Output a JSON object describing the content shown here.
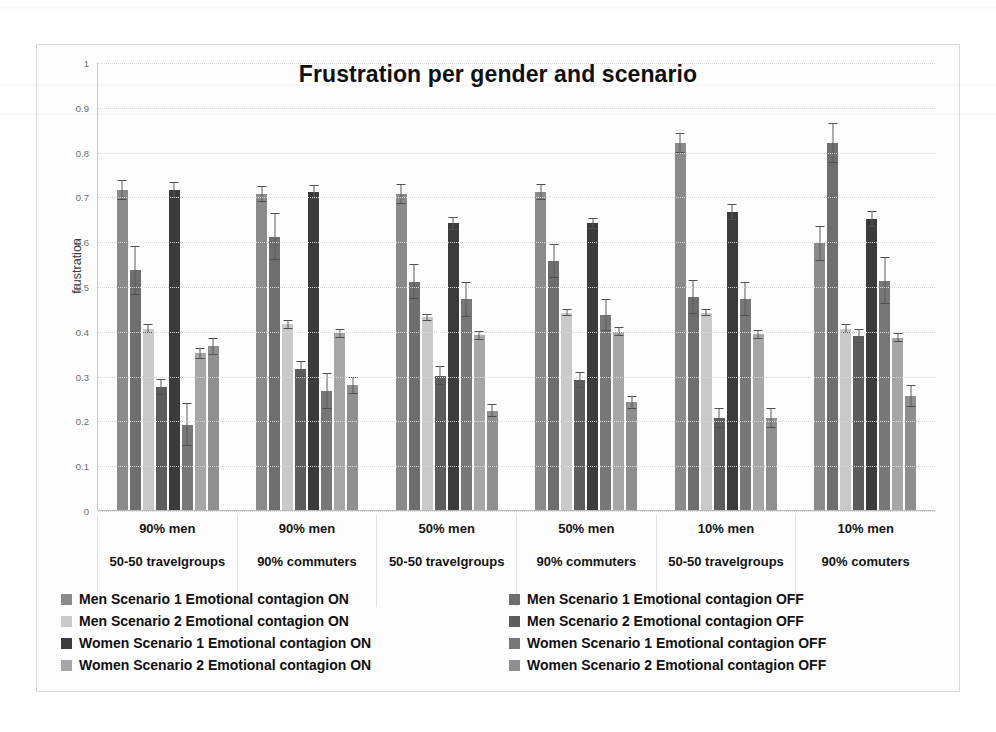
{
  "chart": {
    "title": "Frustration per gender and scenario",
    "ylabel": "frustration",
    "yticks": [
      "1",
      "0.9",
      "0.8",
      "0.7",
      "0.6",
      "0.5",
      "0.4",
      "0.3",
      "0.2",
      "0.1",
      "0"
    ],
    "groups": [
      {
        "line1": "90% men",
        "line2": "50-50 travelgroups"
      },
      {
        "line1": "90% men",
        "line2": "90% commuters"
      },
      {
        "line1": "50% men",
        "line2": "50-50 travelgroups"
      },
      {
        "line1": "50% men",
        "line2": "90% commuters"
      },
      {
        "line1": "10% men",
        "line2": "50-50 travelgroups"
      },
      {
        "line1": "10% men",
        "line2": "90% comuters"
      }
    ],
    "legend": [
      {
        "label": "Men Scenario 1 Emotional contagion ON",
        "color": "#8a8a8a"
      },
      {
        "label": "Men Scenario 1 Emotional contagion OFF",
        "color": "#6e6e6e"
      },
      {
        "label": "Men Scenario 2 Emotional contagion ON",
        "color": "#c9c9c9"
      },
      {
        "label": "Men Scenario 2 Emotional contagion OFF",
        "color": "#5c5c5c"
      },
      {
        "label": "Women Scenario 1 Emotional contagion ON",
        "color": "#3b3b3b"
      },
      {
        "label": "Women Scenario 1 Emotional contagion OFF",
        "color": "#777777"
      },
      {
        "label": "Women Scenario 2 Emotional contagion ON",
        "color": "#a6a6a6"
      },
      {
        "label": "Women Scenario 2 Emotional contagion OFF",
        "color": "#8f8f8f"
      }
    ]
  },
  "chart_data": {
    "type": "bar",
    "title": "Frustration per gender and scenario",
    "xlabel": "",
    "ylabel": "frustration",
    "ylim": [
      0,
      1
    ],
    "yticks": [
      0,
      0.1,
      0.2,
      0.3,
      0.4,
      0.5,
      0.6,
      0.7,
      0.8,
      0.9,
      1
    ],
    "grid": true,
    "legend_position": "bottom",
    "categories": [
      "90% men / 50-50 travelgroups",
      "90% men / 90% commuters",
      "50% men / 50-50 travelgroups",
      "50% men / 90% commuters",
      "10% men / 50-50 travelgroups",
      "10% men / 90% comuters"
    ],
    "series": [
      {
        "name": "Men Scenario 1 Emotional contagion ON",
        "color": "#8a8a8a",
        "values": [
          0.715,
          0.705,
          0.705,
          0.71,
          0.82,
          0.595
        ],
        "errors": [
          0.022,
          0.018,
          0.022,
          0.018,
          0.022,
          0.04
        ]
      },
      {
        "name": "Men Scenario 1 Emotional contagion OFF",
        "color": "#6e6e6e",
        "values": [
          0.535,
          0.61,
          0.51,
          0.555,
          0.475,
          0.82
        ],
        "errors": [
          0.055,
          0.052,
          0.04,
          0.038,
          0.038,
          0.045
        ]
      },
      {
        "name": "Men Scenario 2 Emotional contagion ON",
        "color": "#c9c9c9",
        "values": [
          0.405,
          0.415,
          0.43,
          0.44,
          0.44,
          0.405
        ],
        "errors": [
          0.01,
          0.01,
          0.008,
          0.008,
          0.008,
          0.01
        ]
      },
      {
        "name": "Men Scenario 2 Emotional contagion OFF",
        "color": "#5c5c5c",
        "values": [
          0.275,
          0.315,
          0.3,
          0.29,
          0.205,
          0.388
        ],
        "errors": [
          0.018,
          0.018,
          0.022,
          0.018,
          0.022,
          0.015
        ]
      },
      {
        "name": "Women Scenario 1 Emotional contagion ON",
        "color": "#3b3b3b",
        "values": [
          0.715,
          0.71,
          0.64,
          0.64,
          0.665,
          0.65
        ],
        "errors": [
          0.018,
          0.015,
          0.015,
          0.012,
          0.018,
          0.018
        ]
      },
      {
        "name": "Women Scenario 1 Emotional contagion OFF",
        "color": "#777777",
        "values": [
          0.19,
          0.265,
          0.47,
          0.435,
          0.47,
          0.512
        ],
        "errors": [
          0.048,
          0.04,
          0.04,
          0.035,
          0.038,
          0.052
        ]
      },
      {
        "name": "Women Scenario 2 Emotional contagion ON",
        "color": "#a6a6a6",
        "values": [
          0.35,
          0.395,
          0.39,
          0.398,
          0.392,
          0.385
        ],
        "errors": [
          0.012,
          0.01,
          0.01,
          0.01,
          0.01,
          0.01
        ]
      },
      {
        "name": "Women Scenario 2 Emotional contagion OFF",
        "color": "#8f8f8f",
        "values": [
          0.365,
          0.278,
          0.222,
          0.24,
          0.205,
          0.255
        ],
        "errors": [
          0.02,
          0.02,
          0.015,
          0.015,
          0.022,
          0.025
        ]
      }
    ]
  }
}
